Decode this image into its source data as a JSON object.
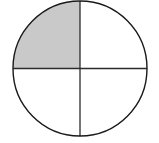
{
  "figure": {
    "background_color": "#ffffff",
    "width": 159,
    "height": 143
  },
  "circle": {
    "name": "fraction-circle",
    "center_x": 80,
    "center_y": 68.5,
    "radius_x": 67,
    "radius_y": 67.5,
    "stroke_color": "#1a1a1a",
    "stroke_width": 1.4,
    "fill_color": "#ffffff"
  },
  "dividers": {
    "vertical": {
      "name": "vertical-diameter",
      "x1": 80,
      "y1": 1,
      "x2": 80,
      "y2": 136,
      "stroke_color": "#2b2b2b",
      "stroke_width": 1.3
    },
    "horizontal": {
      "name": "horizontal-diameter",
      "x1": 13,
      "y1": 68.5,
      "x2": 147,
      "y2": 68.5,
      "stroke_color": "#2b2b2b",
      "stroke_width": 1.3
    }
  },
  "quadrants": [
    {
      "name": "quadrant-upper-left",
      "position": "upper-left",
      "shaded": true,
      "fill_color": "#c9c9c9",
      "path": "M 80 68.5 L 80 1 A 67 67.5 0 0 0 13 68.5 Z"
    },
    {
      "name": "quadrant-upper-right",
      "position": "upper-right",
      "shaded": false,
      "fill_color": "#ffffff",
      "path": "M 80 68.5 L 147 68.5 A 67 67.5 0 0 0 80 1 Z"
    },
    {
      "name": "quadrant-lower-right",
      "position": "lower-right",
      "shaded": false,
      "fill_color": "#ffffff",
      "path": "M 80 68.5 L 80 136 A 67 67.5 0 0 0 147 68.5 Z"
    },
    {
      "name": "quadrant-lower-left",
      "position": "lower-left",
      "shaded": false,
      "fill_color": "#ffffff",
      "path": "M 80 68.5 L 13 68.5 A 67 67.5 0 0 0 80 136 Z"
    }
  ],
  "chart_data": {
    "type": "pie",
    "title": "",
    "labels": [
      "Shaded",
      "Unshaded"
    ],
    "values": [
      1,
      3
    ],
    "fractions": [
      "1/4",
      "3/4"
    ],
    "total_parts": 4,
    "shaded_parts": 1,
    "colors": [
      "#c9c9c9",
      "#ffffff"
    ],
    "legend": "none",
    "grid": false
  }
}
